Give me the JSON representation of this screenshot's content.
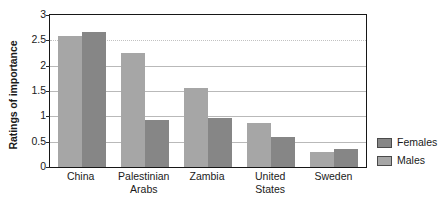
{
  "chart_data": {
    "type": "bar",
    "title": "",
    "subtitle": "",
    "xlabel": "",
    "ylabel": "Ratings of importance",
    "ylim": [
      0,
      3
    ],
    "yticks": [
      0,
      0.5,
      1,
      1.5,
      2,
      2.5,
      3
    ],
    "ytick_labels": [
      "0",
      "0.5",
      "1",
      "1.5",
      "2",
      "2.5",
      "3"
    ],
    "grid": true,
    "grid_axis": "y",
    "legend_position": "right",
    "categories": [
      "China",
      "Palestinian Arabs",
      "Zambia",
      "United States",
      "Sweden"
    ],
    "category_labels": [
      "China",
      "Palestinian\nArabs",
      "Zambia",
      "United\nStates",
      "Sweden"
    ],
    "series": [
      {
        "name": "Males",
        "color": "#a6a6a6",
        "values": [
          2.59,
          2.25,
          1.55,
          0.86,
          0.3
        ]
      },
      {
        "name": "Females",
        "color": "#868686",
        "values": [
          2.66,
          0.93,
          0.97,
          0.59,
          0.35
        ]
      }
    ],
    "series_order_in_plot": [
      "Males",
      "Females"
    ],
    "legend_entries": [
      "Females",
      "Males"
    ],
    "annotations": []
  },
  "colors": {
    "males": "#a6a6a6",
    "females": "#868686",
    "axis": "#171717",
    "gridline": "#b9b9b9",
    "background": "#ffffff",
    "text": "#1a1a1a"
  }
}
